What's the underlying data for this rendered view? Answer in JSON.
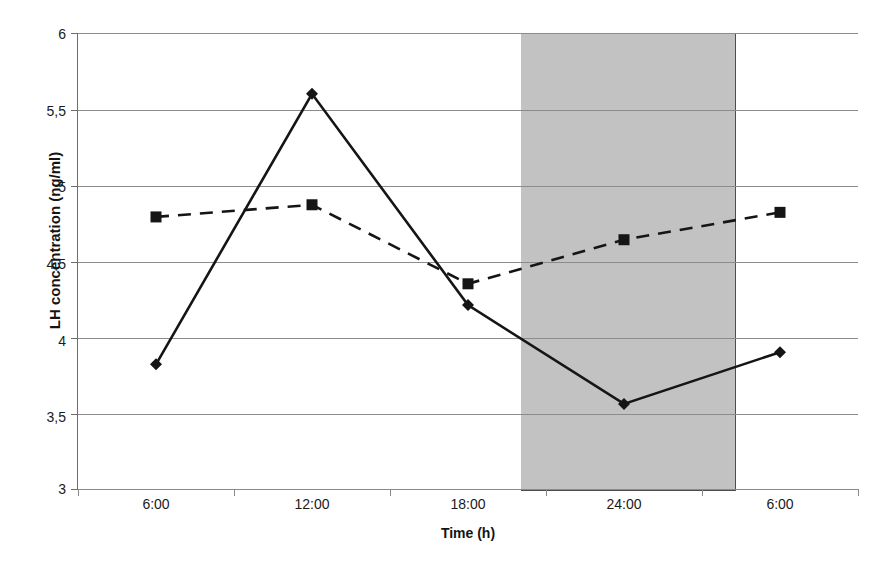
{
  "chart_data": {
    "type": "line",
    "title": "",
    "xlabel": "Time (h)",
    "ylabel": "LH concentration (ng/ml)",
    "categories": [
      "6:00",
      "12:00",
      "18:00",
      "24:00",
      "6:00"
    ],
    "x_tick_labels": [
      "6:00",
      "12:00",
      "18:00",
      "24:00",
      "6:00"
    ],
    "y_tick_labels": [
      "6",
      "5,5",
      "5",
      "4,5",
      "4",
      "3,5",
      "3"
    ],
    "y_tick_values": [
      6,
      5.5,
      5,
      4.5,
      4,
      3.5,
      3
    ],
    "ylim": [
      3,
      6
    ],
    "grid": "horizontal",
    "legend": "none",
    "series": [
      {
        "name": "series-diamond-solid",
        "marker": "diamond",
        "line_style": "solid",
        "color": "#151515",
        "values": [
          3.82,
          5.6,
          4.21,
          3.56,
          3.9
        ]
      },
      {
        "name": "series-square-dashed",
        "marker": "square",
        "line_style": "dashed",
        "color": "#151515",
        "values": [
          4.79,
          4.87,
          4.35,
          4.64,
          4.82
        ]
      }
    ],
    "annotations": [
      {
        "name": "dark-phase-shaded-band",
        "type": "shaded-region",
        "x_start": "20:00",
        "x_end": "04:00",
        "color": "#c2c2c2"
      }
    ]
  }
}
